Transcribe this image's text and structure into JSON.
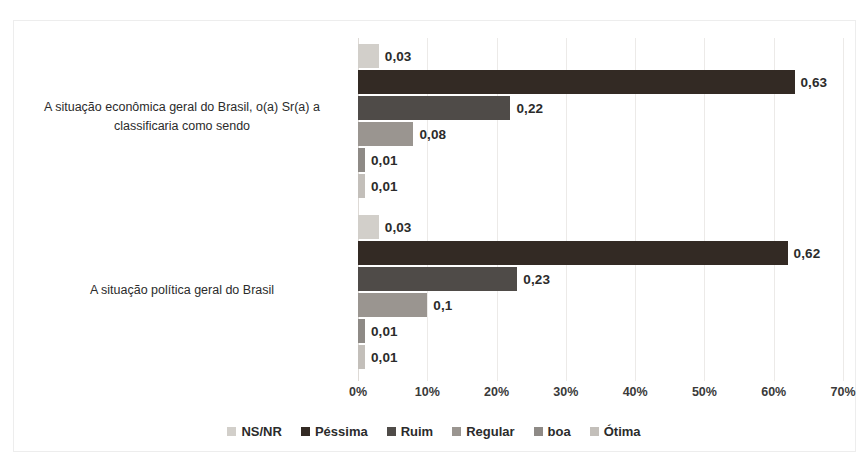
{
  "chart_data": {
    "type": "bar",
    "orientation": "horizontal",
    "title": "",
    "xlabel": "",
    "ylabel": "",
    "xlim": [
      0,
      0.7
    ],
    "xtick_labels": [
      "0%",
      "10%",
      "20%",
      "30%",
      "40%",
      "50%",
      "60%",
      "70%"
    ],
    "xtick_values": [
      0,
      0.1,
      0.2,
      0.3,
      0.4,
      0.5,
      0.6,
      0.7
    ],
    "grid": true,
    "legend_position": "bottom",
    "categories": [
      "A situação econômica geral do Brasil, o(a) Sr(a) a classificaria como sendo",
      "A situação política geral do Brasil"
    ],
    "series": [
      {
        "name": "NS/NR",
        "color": "#d2cfca",
        "values": [
          0.03,
          0.03
        ],
        "labels": [
          "0,03",
          "0,03"
        ]
      },
      {
        "name": "Péssima",
        "color": "#332a24",
        "values": [
          0.63,
          0.62
        ],
        "labels": [
          "0,63",
          "0,62"
        ]
      },
      {
        "name": "Ruim",
        "color": "#4f4b48",
        "values": [
          0.22,
          0.23
        ],
        "labels": [
          "0,22",
          "0,23"
        ]
      },
      {
        "name": "Regular",
        "color": "#9a9590",
        "values": [
          0.08,
          0.1
        ],
        "labels": [
          "0,08",
          "0,1"
        ]
      },
      {
        "name": "boa",
        "color": "#8e8a86",
        "values": [
          0.01,
          0.01
        ],
        "labels": [
          "0,01",
          "0,01"
        ]
      },
      {
        "name": "Ótima",
        "color": "#c3bfba",
        "values": [
          0.01,
          0.01
        ],
        "labels": [
          "0,01",
          "0,01"
        ]
      }
    ]
  },
  "legend": {
    "items": [
      {
        "label": "NS/NR",
        "color": "#d2cfca"
      },
      {
        "label": "Péssima",
        "color": "#332a24"
      },
      {
        "label": "Ruim",
        "color": "#4f4b48"
      },
      {
        "label": "Regular",
        "color": "#9a9590"
      },
      {
        "label": "boa",
        "color": "#8e8a86"
      },
      {
        "label": "Ótima",
        "color": "#c3bfba"
      }
    ]
  }
}
